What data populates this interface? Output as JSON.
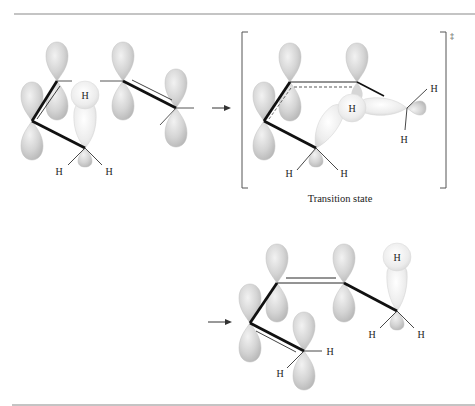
{
  "figure": {
    "caption": "Transition state",
    "dagger": "‡",
    "atom_label": "H",
    "colors": {
      "lobe_fill": "#d6d6d6",
      "lobe_stroke": "#b5b5b5",
      "h_orbital": "#ececec",
      "bond": "#111111",
      "rule": "#8a8a8a"
    },
    "panels": [
      {
        "name": "reactant",
        "h_labels": [
          "H",
          "H",
          "H"
        ]
      },
      {
        "name": "transition-state",
        "h_labels": [
          "H",
          "H",
          "H",
          "H",
          "H"
        ]
      },
      {
        "name": "product",
        "h_labels": [
          "H",
          "H",
          "H",
          "H",
          "H"
        ]
      }
    ]
  }
}
